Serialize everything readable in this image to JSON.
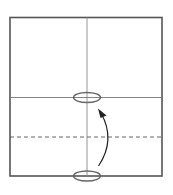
{
  "diagram": {
    "type": "origami-fold-step",
    "paper": {
      "x": 9,
      "y": 17,
      "width": 153,
      "height": 159,
      "stroke": "#555555"
    },
    "creases": {
      "vertical_center_x": 87,
      "horizontal_center_y": 97,
      "color": "#777777"
    },
    "valley_fold_line": {
      "y": 137,
      "style": "dashed",
      "color": "#555555"
    },
    "markers": [
      {
        "name": "target-point",
        "cx": 87,
        "cy": 97,
        "rx": 13,
        "ry": 5
      },
      {
        "name": "source-point",
        "cx": 87,
        "cy": 176,
        "rx": 13,
        "ry": 5
      }
    ],
    "arrow": {
      "from": [
        99,
        166
      ],
      "to": [
        99,
        110
      ],
      "direction": "up",
      "meaning": "fold bottom edge up to center"
    },
    "colors": {
      "line": "#555555",
      "marker": "#666666",
      "arrow": "#222222"
    }
  }
}
